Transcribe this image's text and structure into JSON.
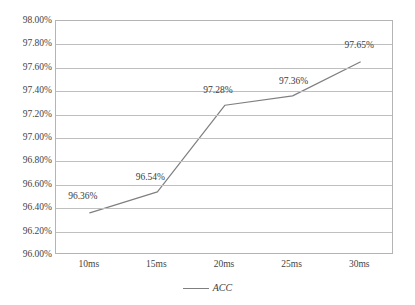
{
  "chart_data": {
    "type": "line",
    "title": "",
    "xlabel": "",
    "ylabel": "",
    "categories": [
      "10ms",
      "15ms",
      "20ms",
      "25ms",
      "30ms"
    ],
    "series": [
      {
        "name": "ACC",
        "values": [
          96.36,
          96.54,
          97.28,
          97.36,
          97.65
        ],
        "value_labels": [
          "96.36%",
          "96.54%",
          "97.28%",
          "97.36%",
          "97.65%"
        ],
        "color": "#7f7f7f"
      }
    ],
    "ylim": [
      96.0,
      98.0
    ],
    "ytick_step": 0.2,
    "ytick_labels": [
      "98.00%",
      "97.80%",
      "97.60%",
      "97.40%",
      "97.20%",
      "97.00%",
      "96.80%",
      "96.60%",
      "96.40%",
      "96.20%",
      "96.00%"
    ],
    "ytick_values": [
      98.0,
      97.8,
      97.6,
      97.4,
      97.2,
      97.0,
      96.8,
      96.6,
      96.4,
      96.2,
      96.0
    ],
    "grid": true,
    "grid_color": "#bfbfbf",
    "plot_border_color": "#b4b4b4",
    "legend_position": "bottom",
    "legend_entries": [
      "ACC"
    ]
  },
  "legend": {
    "label": "ACC"
  }
}
